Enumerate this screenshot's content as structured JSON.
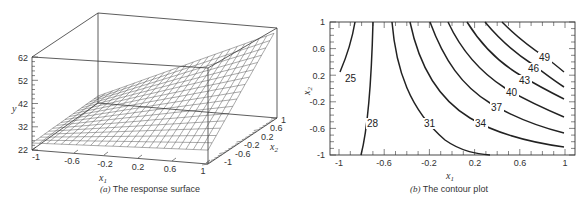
{
  "chart_data": [
    {
      "type": "surface",
      "panel": "a",
      "caption_letter": "(a)",
      "caption_text": "The response surface",
      "xlabel": "x1",
      "ylabel": "y",
      "zlabel": "x2",
      "x1_ticks": [
        "-1",
        "-0.6",
        "-0.2",
        "0.2",
        "0.6",
        "1"
      ],
      "x2_ticks": [
        "-1",
        "-0.6",
        "-0.2",
        "0.2",
        "0.6",
        "1"
      ],
      "y_ticks": [
        "22",
        "32",
        "42",
        "52",
        "62"
      ],
      "x1_range": [
        -1,
        1
      ],
      "x2_range": [
        -1,
        1
      ],
      "y_range": [
        22,
        62
      ],
      "surface_corners": [
        {
          "x1": -1,
          "x2": -1,
          "y": 25
        },
        {
          "x1": -1,
          "x2": 1,
          "y": 25
        },
        {
          "x1": 1,
          "x2": -1,
          "y": 28
        },
        {
          "x1": 1,
          "x2": 1,
          "y": 58
        }
      ]
    },
    {
      "type": "contour",
      "panel": "b",
      "caption_letter": "(b)",
      "caption_text": "The contour plot",
      "xlabel": "x1",
      "ylabel": "x2",
      "x_ticks": [
        "-1",
        "-0.6",
        "-0.2",
        "0.2",
        "0.6",
        "1"
      ],
      "y_ticks": [
        "1",
        "0.6",
        "0.2",
        "-0.2",
        "-0.6",
        "-1"
      ],
      "xlim": [
        -1,
        1
      ],
      "ylim": [
        -1,
        1
      ],
      "levels": [
        25,
        28,
        31,
        34,
        37,
        40,
        43,
        46,
        49
      ],
      "level_labels": [
        "25",
        "28",
        "31",
        "34",
        "37",
        "40",
        "43",
        "46",
        "49"
      ]
    }
  ]
}
